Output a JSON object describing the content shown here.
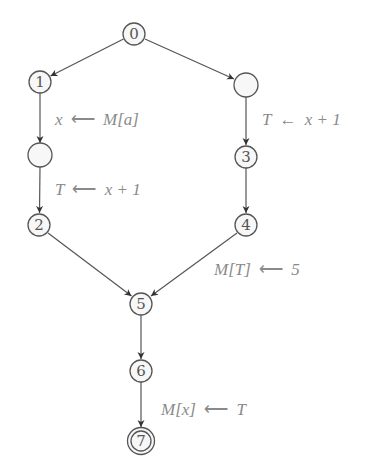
{
  "diagram": {
    "type": "control-flow-graph",
    "colors": {
      "stroke": "#555555",
      "node_fill": "#f7f7f7",
      "label": "#8a8a8a"
    },
    "nodes": [
      {
        "id": "n0",
        "label": "0",
        "x": 134,
        "y": 34
      },
      {
        "id": "n1",
        "label": "1",
        "x": 40,
        "y": 82
      },
      {
        "id": "na",
        "label": "",
        "x": 40,
        "y": 155
      },
      {
        "id": "n2",
        "label": "2",
        "x": 39,
        "y": 225
      },
      {
        "id": "nb",
        "label": "",
        "x": 246,
        "y": 85
      },
      {
        "id": "n3",
        "label": "3",
        "x": 246,
        "y": 157
      },
      {
        "id": "n4",
        "label": "4",
        "x": 246,
        "y": 225
      },
      {
        "id": "n5",
        "label": "5",
        "x": 141,
        "y": 304
      },
      {
        "id": "n6",
        "label": "6",
        "x": 141,
        "y": 371
      },
      {
        "id": "n7",
        "label": "7",
        "x": 141,
        "y": 441,
        "accepting": true
      }
    ],
    "edges": [
      {
        "from": "n0",
        "to": "n1",
        "label": ""
      },
      {
        "from": "n0",
        "to": "nb",
        "label": ""
      },
      {
        "from": "n1",
        "to": "na",
        "label": "x ⟵ M[a]"
      },
      {
        "from": "na",
        "to": "n2",
        "label": "T ⟵ x + 1"
      },
      {
        "from": "nb",
        "to": "n3",
        "label": "T ← x + 1"
      },
      {
        "from": "n3",
        "to": "n4",
        "label": ""
      },
      {
        "from": "n2",
        "to": "n5",
        "label": ""
      },
      {
        "from": "n4",
        "to": "n5",
        "label": "M[T] ⟵ 5"
      },
      {
        "from": "n5",
        "to": "n6",
        "label": ""
      },
      {
        "from": "n6",
        "to": "n7",
        "label": "M[x] ⟵ T"
      }
    ],
    "edge_labels": {
      "e1_lhs": "x",
      "e1_arrow": "⟵",
      "e1_rhs": "M[a]",
      "e2_lhs": "T",
      "e2_arrow": "⟵",
      "e2_rhs": "x + 1",
      "e3_lhs": "T",
      "e3_arrow": "←",
      "e3_rhs": "x + 1",
      "e4_lhs": "M[T]",
      "e4_arrow": "⟵",
      "e4_rhs": "5",
      "e5_lhs": "M[x]",
      "e5_arrow": "⟵",
      "e5_rhs": "T"
    },
    "node_labels": {
      "n0": "0",
      "n1": "1",
      "n2": "2",
      "n3": "3",
      "n4": "4",
      "n5": "5",
      "n6": "6",
      "n7": "7"
    }
  }
}
